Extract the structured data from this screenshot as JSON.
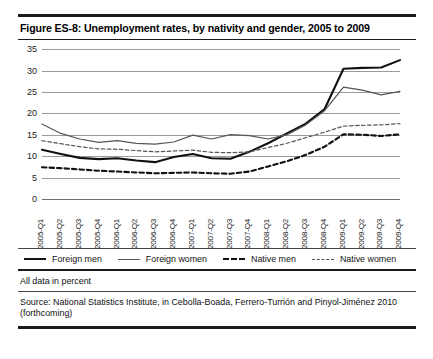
{
  "figure": {
    "title": "Figure ES-8:  Unemployment rates, by nativity and gender, 2005 to 2009",
    "note": "All data in percent",
    "source": "Source: National Statistics Institute, in Cebolla-Boada, Ferrero-Turrión and Pinyol-Jiménez 2010 (forthcoming)"
  },
  "legend": {
    "items": [
      {
        "label": "Foreign men",
        "style": "solid-thick",
        "color": "#111111"
      },
      {
        "label": "Foreign women",
        "style": "solid-thin",
        "color": "#555555"
      },
      {
        "label": "Native men",
        "style": "dashed-thick",
        "color": "#111111"
      },
      {
        "label": "Native women",
        "style": "dashed-thin",
        "color": "#555555"
      }
    ]
  },
  "chart_data": {
    "type": "line",
    "title": "Unemployment rates, by nativity and gender, 2005 to 2009",
    "xlabel": "",
    "ylabel": "",
    "ylim": [
      0,
      35
    ],
    "yticks": [
      0,
      5,
      10,
      15,
      20,
      25,
      30,
      35
    ],
    "grid": true,
    "legend_position": "bottom",
    "units": "percent",
    "categories": [
      "2005-Q1",
      "2005-Q2",
      "2005-Q3",
      "2005-Q4",
      "2006-Q1",
      "2006-Q2",
      "2006-Q3",
      "2006-Q4",
      "2007-Q1",
      "2007-Q2",
      "2007-Q3",
      "2007-Q4",
      "2008-Q1",
      "2008-Q2",
      "2008-Q3",
      "2008-Q4",
      "2009-Q1",
      "2009-Q2",
      "2009-Q3",
      "2009-Q4"
    ],
    "series": [
      {
        "name": "Foreign men",
        "values": [
          11.5,
          10.5,
          9.6,
          9.3,
          9.5,
          9.0,
          8.6,
          9.8,
          10.5,
          9.5,
          9.4,
          11.0,
          13.0,
          15.3,
          17.6,
          21.0,
          30.4,
          30.6,
          30.7,
          32.4
        ]
      },
      {
        "name": "Foreign women",
        "values": [
          17.5,
          15.3,
          14.0,
          13.2,
          13.6,
          13.0,
          12.8,
          13.3,
          14.9,
          14.0,
          15.0,
          14.8,
          14.0,
          15.0,
          17.3,
          20.6,
          26.1,
          25.4,
          24.3,
          25.1
        ]
      },
      {
        "name": "Native men",
        "values": [
          7.4,
          7.2,
          6.9,
          6.6,
          6.4,
          6.2,
          6.0,
          6.1,
          6.2,
          6.0,
          5.9,
          6.4,
          7.6,
          8.8,
          10.3,
          12.2,
          15.1,
          15.0,
          14.7,
          15.1
        ]
      },
      {
        "name": "Native women",
        "values": [
          13.6,
          12.9,
          12.2,
          11.7,
          11.6,
          11.3,
          11.0,
          11.2,
          11.4,
          10.9,
          10.8,
          11.0,
          12.0,
          13.0,
          14.3,
          15.6,
          17.0,
          17.2,
          17.3,
          17.6
        ]
      }
    ]
  }
}
